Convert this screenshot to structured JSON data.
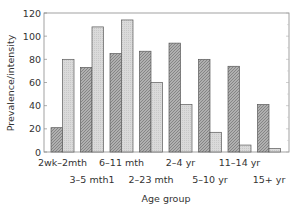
{
  "chart_data": {
    "type": "bar",
    "title": "",
    "xlabel": "Age group",
    "ylabel": "Prevalence/intensity",
    "ylim": [
      0,
      120
    ],
    "yticks": [
      0,
      20,
      40,
      60,
      80,
      100,
      120
    ],
    "grid": false,
    "legend": null,
    "categories": [
      "2wk–2mth",
      "3–5 mth1",
      "6–11 mth",
      "2–23 mth",
      "2–4 yr",
      "5–10 yr",
      "11–14 yr",
      "15+ yr"
    ],
    "series": [
      {
        "name": "Series 1 (dark hatched)",
        "color": "#9a9a9a",
        "values": [
          21,
          73,
          85,
          87,
          94,
          80,
          74,
          41
        ]
      },
      {
        "name": "Series 2 (light)",
        "color": "#d4d4d4",
        "values": [
          80,
          108,
          114,
          60,
          41,
          17,
          6,
          3
        ]
      }
    ]
  },
  "labels": {
    "xlabel": "Age group",
    "ylabel": "Prevalence/intensity",
    "yticks": [
      "0",
      "20",
      "40",
      "60",
      "80",
      "100",
      "120"
    ],
    "categories": [
      "2wk–2mth",
      "3–5 mth1",
      "6–11 mth",
      "2–23 mth",
      "2–4 yr",
      "5–10 yr",
      "11–14 yr",
      "15+ yr"
    ]
  }
}
